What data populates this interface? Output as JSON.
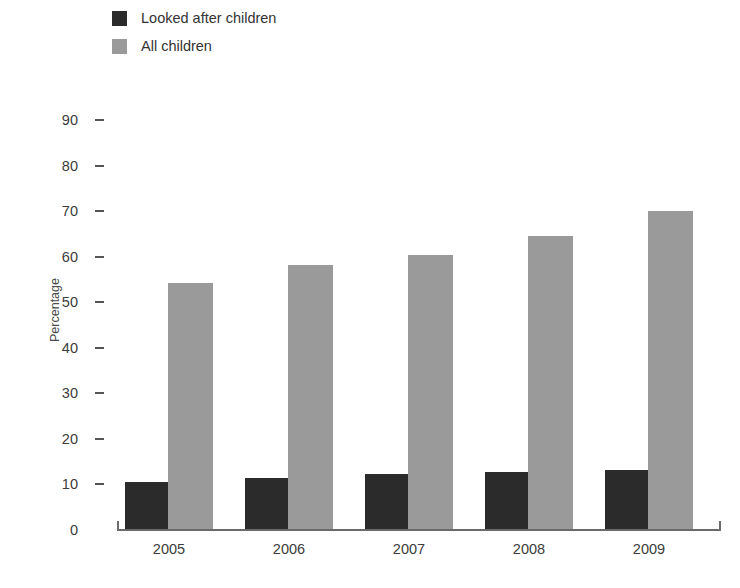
{
  "legend": {
    "items": [
      {
        "label": "Looked after children",
        "color": "#2b2b2b",
        "key": "looked_after"
      },
      {
        "label": "All children",
        "color": "#9a9a9a",
        "key": "all_children"
      }
    ]
  },
  "axes": {
    "y_title": "Percentage",
    "y_ticks": [
      "90",
      "80",
      "70",
      "60",
      "50",
      "40",
      "30",
      "20",
      "10",
      "0"
    ],
    "x_ticks": [
      "2005",
      "2006",
      "2007",
      "2008",
      "2009"
    ]
  },
  "chart_data": {
    "type": "bar",
    "title": "",
    "xlabel": "",
    "ylabel": "Percentage",
    "categories": [
      "2005",
      "2006",
      "2007",
      "2008",
      "2009"
    ],
    "series": [
      {
        "name": "Looked after children",
        "color": "#2b2b2b",
        "values": [
          10.6,
          11.4,
          12.3,
          12.7,
          13.1
        ]
      },
      {
        "name": "All children",
        "color": "#9a9a9a",
        "values": [
          54.3,
          58.2,
          60.3,
          64.6,
          70.0
        ]
      }
    ],
    "ylim": [
      0,
      90
    ],
    "ytick_step": 10,
    "grid": false,
    "legend_position": "top-left"
  }
}
